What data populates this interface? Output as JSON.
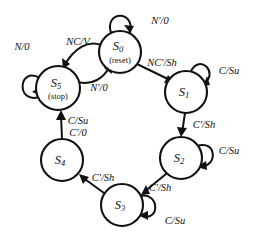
{
  "diagram": {
    "type": "finite-state-machine",
    "background_color": "#ffffff",
    "stroke_color": "#111111",
    "states": [
      {
        "id": "S0",
        "label": "S",
        "index": "0",
        "sublabel": "(reset)",
        "cx": 120,
        "cy": 52,
        "r": 21
      },
      {
        "id": "S1",
        "label": "S",
        "index": "1",
        "sublabel": "",
        "cx": 186,
        "cy": 92,
        "r": 21
      },
      {
        "id": "S2",
        "label": "S",
        "index": "2",
        "sublabel": "",
        "cx": 181,
        "cy": 158,
        "r": 21
      },
      {
        "id": "S3",
        "label": "S",
        "index": "3",
        "sublabel": "",
        "cx": 122,
        "cy": 205,
        "r": 21
      },
      {
        "id": "S4",
        "label": "S",
        "index": "4",
        "sublabel": "",
        "cx": 62,
        "cy": 160,
        "r": 21
      },
      {
        "id": "S5",
        "label": "S",
        "index": "5",
        "sublabel": "(stop)",
        "cx": 58,
        "cy": 88,
        "r": 22
      }
    ],
    "transitions": [
      {
        "id": "t-s0-self",
        "from": "S0",
        "to": "S0",
        "kind": "self",
        "label": "N′/0",
        "label_x": 160,
        "label_y": 22
      },
      {
        "id": "t-s0-s5",
        "from": "S0",
        "to": "S5",
        "kind": "curve",
        "label": "NC/V",
        "label_x": 78,
        "label_y": 43
      },
      {
        "id": "t-s5-s0",
        "from": "S5",
        "to": "S0",
        "kind": "curve",
        "label": "N′/0",
        "label_x": 99,
        "label_y": 89
      },
      {
        "id": "t-s5-self",
        "from": "S5",
        "to": "S5",
        "kind": "self",
        "label": "N/0",
        "label_x": 22,
        "label_y": 48
      },
      {
        "id": "t-s0-s1",
        "from": "S0",
        "to": "S1",
        "kind": "line",
        "label": "NC′/Sh",
        "label_x": 162,
        "label_y": 64
      },
      {
        "id": "t-s1-self",
        "from": "S1",
        "to": "S1",
        "kind": "self",
        "label": "C/Su",
        "label_x": 229,
        "label_y": 72
      },
      {
        "id": "t-s1-s2",
        "from": "S1",
        "to": "S2",
        "kind": "line",
        "label": "C′/Sh",
        "label_x": 204,
        "label_y": 126
      },
      {
        "id": "t-s2-self",
        "from": "S2",
        "to": "S2",
        "kind": "self",
        "label": "C/Su",
        "label_x": 229,
        "label_y": 152
      },
      {
        "id": "t-s2-s3",
        "from": "S2",
        "to": "S3",
        "kind": "line",
        "label": "C′/Sh",
        "label_x": 160,
        "label_y": 189
      },
      {
        "id": "t-s3-self",
        "from": "S3",
        "to": "S3",
        "kind": "self",
        "label": "C/Su",
        "label_x": 175,
        "label_y": 222
      },
      {
        "id": "t-s3-s4",
        "from": "S3",
        "to": "S4",
        "kind": "line",
        "label": "C′/Sh",
        "label_x": 103,
        "label_y": 179
      },
      {
        "id": "t-s4-s5a",
        "from": "S4",
        "to": "S5",
        "kind": "line",
        "label": "C/Su",
        "label_x": 78,
        "label_y": 122
      },
      {
        "id": "t-s4-s5b",
        "from": "S4",
        "to": "S5",
        "kind": "line",
        "label": "C′/0",
        "label_x": 78,
        "label_y": 134
      }
    ]
  }
}
